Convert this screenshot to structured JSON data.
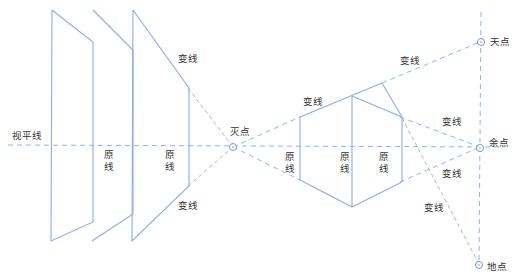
{
  "diagram": {
    "type": "perspective-drawing",
    "colors": {
      "solid_line": "#8aaee0",
      "dashed_line": "#9fbfe0",
      "gray_dashed": "#b5b5b5",
      "point": "#6f9ad6",
      "text": "#333333"
    },
    "labels": {
      "horizon_line": "视平线",
      "vanishing_point": "灭点",
      "sky_point": "天点",
      "remaining_point": "余点",
      "ground_point": "地点",
      "change_line": "变线",
      "original_line": "原线"
    },
    "left_group": {
      "change_line_top": "变线",
      "change_line_bottom": "变线",
      "original_line_1": "原线",
      "original_line_2": "原线"
    },
    "right_group": {
      "change_line_top_left": "变线",
      "change_line_top_right": "变线",
      "change_line_mid_right": "变线",
      "change_line_low_right": "变线",
      "change_line_bottom": "变线",
      "original_line_1": "原线",
      "original_line_2": "原线",
      "original_line_3": "原线"
    }
  }
}
